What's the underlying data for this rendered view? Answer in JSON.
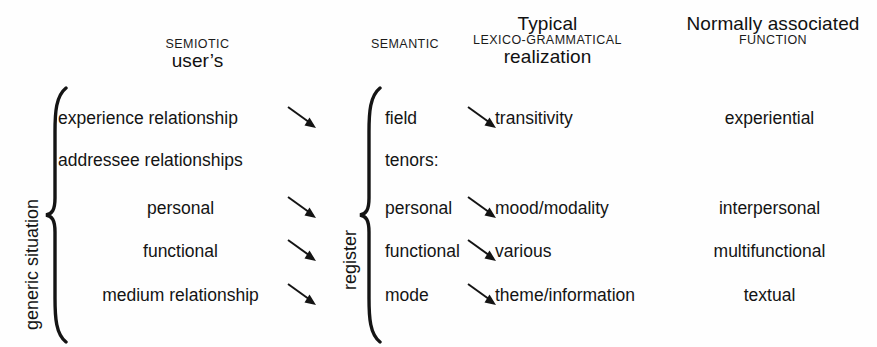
{
  "diagram": {
    "ink_color": "#141414",
    "background_color": "#fefefe"
  },
  "headers": {
    "semiotic": {
      "small": "SEMIOTIC",
      "big": "user’s"
    },
    "semantic": {
      "small": "SEMANTIC",
      "big": ""
    },
    "lexico_grammatical": {
      "top": "Typical",
      "small": "LEXICO-GRAMMATICAL",
      "big": "realization"
    },
    "function": {
      "top": "Normally associated",
      "small": "FUNCTION",
      "big": ""
    }
  },
  "braces": {
    "left_label": "generic situation",
    "right_label": "register"
  },
  "rows": [
    {
      "situation": "experience relationship",
      "register": "field",
      "lexico_grammatical": "transitivity",
      "function": "experiential",
      "arrow_situation_to_register": true,
      "arrow_register_to_lexgram": true
    },
    {
      "situation": "addressee relationships",
      "register": "tenors:",
      "lexico_grammatical": "",
      "function": "",
      "arrow_situation_to_register": false,
      "arrow_register_to_lexgram": false
    },
    {
      "situation": "personal",
      "register": "personal",
      "lexico_grammatical": "mood/modality",
      "function": "interpersonal",
      "arrow_situation_to_register": true,
      "arrow_register_to_lexgram": true
    },
    {
      "situation": "functional",
      "register": "functional",
      "lexico_grammatical": "various",
      "function": "multifunctional",
      "arrow_situation_to_register": true,
      "arrow_register_to_lexgram": true
    },
    {
      "situation": "medium relationship",
      "register": "mode",
      "lexico_grammatical": "theme/information",
      "function": "textual",
      "arrow_situation_to_register": true,
      "arrow_register_to_lexgram": true
    }
  ]
}
